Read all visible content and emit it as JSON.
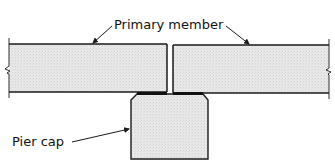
{
  "diagram": {
    "labels": {
      "primary_member": "Primary member",
      "pier_cap": "Pier cap"
    },
    "colors": {
      "line": "#1a1a1a",
      "fill": "#e6e6e6",
      "background": "#ffffff"
    },
    "components": [
      "left-primary-member",
      "right-primary-member",
      "pier-cap",
      "bearing-pads"
    ]
  }
}
